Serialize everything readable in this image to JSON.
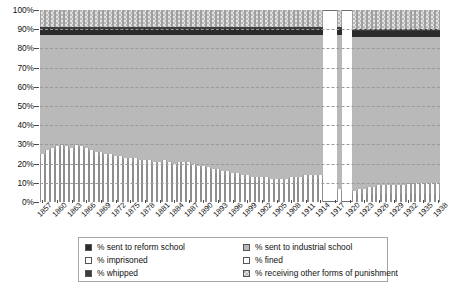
{
  "chart_data": {
    "type": "bar",
    "stacked": true,
    "title": "",
    "subtitle": "",
    "xlabel": "",
    "ylabel": "",
    "ylim": [
      0,
      100
    ],
    "ytick_labels": [
      "100%",
      "90%",
      "80%",
      "70%",
      "60%",
      "50%",
      "40%",
      "30%",
      "20%",
      "10%",
      "0%"
    ],
    "ytick_values": [
      100,
      90,
      80,
      70,
      60,
      50,
      40,
      30,
      20,
      10,
      0
    ],
    "grid": true,
    "legend_position": "bottom",
    "x": [
      1857,
      1858,
      1859,
      1860,
      1861,
      1862,
      1863,
      1864,
      1865,
      1866,
      1867,
      1868,
      1869,
      1870,
      1871,
      1872,
      1873,
      1874,
      1875,
      1876,
      1877,
      1878,
      1879,
      1880,
      1881,
      1882,
      1883,
      1884,
      1885,
      1886,
      1887,
      1888,
      1889,
      1890,
      1891,
      1892,
      1893,
      1894,
      1895,
      1896,
      1897,
      1898,
      1899,
      1900,
      1901,
      1902,
      1903,
      1904,
      1905,
      1906,
      1907,
      1908,
      1909,
      1910,
      1911,
      1912,
      1913,
      1914,
      1915,
      1916,
      1917,
      1918,
      1919,
      1920,
      1921,
      1922,
      1923,
      1924,
      1925,
      1926,
      1927,
      1928,
      1929,
      1930,
      1931,
      1932,
      1933,
      1934,
      1935,
      1936,
      1937,
      1938
    ],
    "xtick_labels": [
      "1857",
      "1860",
      "1863",
      "1866",
      "1869",
      "1872",
      "1875",
      "1878",
      "1881",
      "1884",
      "1887",
      "1890",
      "1893",
      "1896",
      "1899",
      "1902",
      "1905",
      "1908",
      "1911",
      "1914",
      "1917",
      "1920",
      "1923",
      "1926",
      "1929",
      "1932",
      "1935",
      "1938"
    ],
    "xtick_step": 3,
    "missing_years": [
      1915,
      1916,
      1917,
      1919,
      1920
    ],
    "series": [
      {
        "name": "% imprisoned",
        "color": "#ffffff",
        "values": [
          23,
          25,
          26,
          27,
          28,
          27,
          26,
          28,
          27,
          26,
          25,
          24,
          24,
          23,
          23,
          22,
          22,
          21,
          21,
          21,
          20,
          20,
          20,
          19,
          19,
          20,
          19,
          18,
          19,
          19,
          19,
          18,
          17,
          17,
          16,
          15,
          15,
          14,
          14,
          13,
          13,
          12,
          12,
          11,
          11,
          11,
          11,
          10,
          10,
          10,
          10,
          11,
          11,
          11,
          12,
          12,
          12,
          12,
          null,
          null,
          null,
          5,
          null,
          null,
          4,
          4,
          4,
          4,
          4,
          4,
          4,
          4,
          4,
          4,
          4,
          4,
          4,
          4,
          4,
          4,
          4,
          4
        ]
      },
      {
        "name": "% fined",
        "color": "#fcfcfc",
        "values": [
          2,
          2,
          2,
          2,
          2,
          2,
          2,
          2,
          2,
          2,
          2,
          2,
          2,
          2,
          2,
          2,
          2,
          2,
          2,
          2,
          2,
          2,
          2,
          2,
          2,
          2,
          2,
          2,
          2,
          2,
          2,
          2,
          2,
          2,
          2,
          2,
          2,
          2,
          2,
          2,
          2,
          2,
          2,
          2,
          2,
          2,
          2,
          2,
          2,
          2,
          2,
          2,
          2,
          2,
          2,
          2,
          2,
          2,
          null,
          null,
          null,
          2,
          null,
          null,
          2,
          3,
          3,
          4,
          4,
          5,
          5,
          5,
          5,
          5,
          5,
          6,
          6,
          6,
          6,
          6,
          6,
          6
        ]
      },
      {
        "name": "% sent to industrial school",
        "color": "#b9b9b9",
        "values": [
          62,
          60,
          59,
          58,
          57,
          58,
          59,
          57,
          58,
          59,
          60,
          61,
          61,
          62,
          62,
          63,
          63,
          64,
          64,
          64,
          65,
          65,
          65,
          66,
          66,
          65,
          66,
          67,
          66,
          66,
          66,
          67,
          68,
          68,
          69,
          70,
          70,
          71,
          71,
          72,
          72,
          73,
          73,
          74,
          74,
          74,
          74,
          75,
          75,
          75,
          75,
          74,
          74,
          74,
          73,
          73,
          73,
          73,
          null,
          null,
          null,
          80,
          null,
          null,
          80,
          79,
          79,
          78,
          78,
          77,
          77,
          77,
          77,
          77,
          77,
          76,
          76,
          76,
          76,
          76,
          76,
          76
        ]
      },
      {
        "name": "% sent to reform school",
        "color": "#2b2b2b",
        "values": [
          3,
          3,
          3,
          3,
          3,
          3,
          3,
          3,
          3,
          3,
          3,
          3,
          3,
          3,
          3,
          3,
          3,
          3,
          3,
          3,
          3,
          3,
          3,
          3,
          3,
          3,
          3,
          3,
          3,
          3,
          3,
          3,
          3,
          3,
          3,
          3,
          3,
          3,
          3,
          3,
          3,
          3,
          3,
          3,
          3,
          3,
          3,
          3,
          3,
          3,
          3,
          3,
          3,
          3,
          3,
          3,
          3,
          3,
          null,
          null,
          null,
          3,
          null,
          null,
          3,
          3,
          3,
          3,
          3,
          3,
          3,
          3,
          3,
          3,
          3,
          3,
          3,
          3,
          3,
          3,
          3,
          3
        ]
      },
      {
        "name": "% whipped",
        "color": "#3d3d3d",
        "values": [
          1,
          1,
          1,
          1,
          1,
          1,
          1,
          1,
          1,
          1,
          1,
          1,
          1,
          1,
          1,
          1,
          1,
          1,
          1,
          1,
          1,
          1,
          1,
          1,
          1,
          1,
          1,
          1,
          1,
          1,
          1,
          1,
          1,
          1,
          1,
          1,
          1,
          1,
          1,
          1,
          1,
          1,
          1,
          1,
          1,
          1,
          1,
          1,
          1,
          1,
          1,
          1,
          1,
          1,
          1,
          1,
          1,
          1,
          null,
          null,
          null,
          1,
          null,
          null,
          1,
          1,
          1,
          1,
          1,
          1,
          1,
          1,
          1,
          1,
          1,
          1,
          1,
          1,
          1,
          1,
          1,
          1
        ]
      },
      {
        "name": "% receiving other forms of punishment",
        "color": "#e3e3e3",
        "values": [
          9,
          9,
          9,
          9,
          9,
          9,
          9,
          9,
          9,
          9,
          9,
          9,
          9,
          9,
          9,
          9,
          9,
          9,
          9,
          9,
          9,
          9,
          9,
          9,
          9,
          9,
          9,
          9,
          9,
          9,
          9,
          9,
          9,
          9,
          9,
          9,
          9,
          9,
          9,
          9,
          9,
          9,
          9,
          9,
          9,
          9,
          9,
          9,
          9,
          9,
          9,
          9,
          9,
          9,
          9,
          9,
          9,
          9,
          null,
          null,
          null,
          9,
          null,
          null,
          10,
          10,
          10,
          10,
          10,
          10,
          10,
          10,
          10,
          10,
          10,
          10,
          10,
          10,
          10,
          10,
          10,
          10
        ]
      }
    ]
  },
  "legend": {
    "items": [
      {
        "label": "% sent to reform school",
        "swatch": "reform"
      },
      {
        "label": "% sent to industrial school",
        "swatch": "industrial"
      },
      {
        "label": "% imprisoned",
        "swatch": "imprisoned"
      },
      {
        "label": "% fined",
        "swatch": "fined"
      },
      {
        "label": "% whipped",
        "swatch": "whipped"
      },
      {
        "label": "% receiving other forms of punishment",
        "swatch": "other"
      }
    ]
  }
}
